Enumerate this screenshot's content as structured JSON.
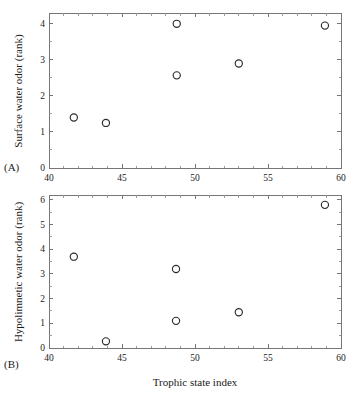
{
  "figure": {
    "xlabel": "Trophic state index",
    "panel_tags": {
      "a": "(A)",
      "b": "(B)"
    }
  },
  "chart_data": [
    {
      "type": "scatter",
      "panel": "(A)",
      "title": "",
      "xlabel": "Trophic state index",
      "ylabel": "Surface water odor (rank)",
      "xlim": [
        40,
        60
      ],
      "ylim": [
        0,
        4.3
      ],
      "xticks": [
        40,
        45,
        50,
        55,
        60
      ],
      "xtick_labels": [
        "40",
        "45",
        "50",
        "55",
        "60"
      ],
      "yticks": [
        0,
        1,
        2,
        3,
        4
      ],
      "ytick_labels": [
        "0",
        "1",
        "2",
        "3",
        "4"
      ],
      "x_minor_step": 1,
      "y_minor_step": 0.5,
      "grid": false,
      "legend": false,
      "marker": "open-circle",
      "points": [
        {
          "x": 41.7,
          "y": 1.4
        },
        {
          "x": 43.9,
          "y": 1.25
        },
        {
          "x": 48.75,
          "y": 4.0
        },
        {
          "x": 48.75,
          "y": 2.57
        },
        {
          "x": 53.0,
          "y": 2.9
        },
        {
          "x": 58.9,
          "y": 3.95
        }
      ]
    },
    {
      "type": "scatter",
      "panel": "(B)",
      "title": "",
      "xlabel": "Trophic state index",
      "ylabel": "Hypolimnetic water odor (rank)",
      "xlim": [
        40,
        60
      ],
      "ylim": [
        0,
        6.2
      ],
      "xticks": [
        40,
        45,
        50,
        55,
        60
      ],
      "xtick_labels": [
        "40",
        "45",
        "50",
        "55",
        "60"
      ],
      "yticks": [
        0,
        1,
        2,
        3,
        4,
        5,
        6
      ],
      "ytick_labels": [
        "0",
        "1",
        "2",
        "3",
        "4",
        "5",
        "6"
      ],
      "x_minor_step": 1,
      "y_minor_step": 0.5,
      "grid": false,
      "legend": false,
      "marker": "open-circle",
      "points": [
        {
          "x": 41.7,
          "y": 3.7
        },
        {
          "x": 43.9,
          "y": 0.27
        },
        {
          "x": 48.7,
          "y": 3.2
        },
        {
          "x": 48.7,
          "y": 1.1
        },
        {
          "x": 53.0,
          "y": 1.45
        },
        {
          "x": 58.9,
          "y": 5.8
        }
      ]
    }
  ]
}
